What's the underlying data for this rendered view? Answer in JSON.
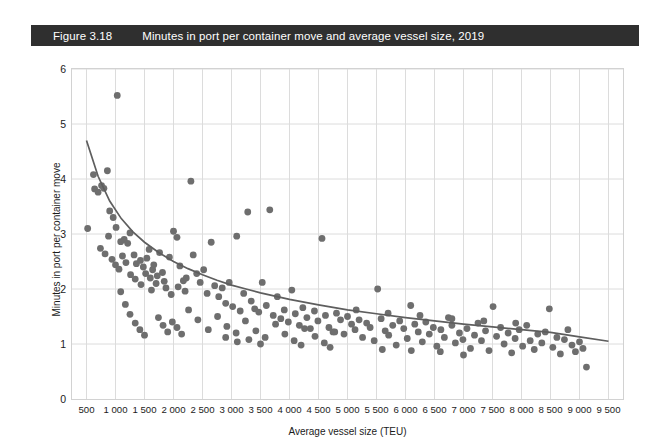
{
  "figure": {
    "number": "Figure 3.18",
    "title": "Minutes in port per container move and average vessel size, 2019",
    "bar_color": "#2f2f2f",
    "bar_text_color": "#ffffff"
  },
  "chart_data": {
    "type": "scatter",
    "title": "Minutes in port per container move and average vessel size, 2019",
    "xlabel": "Average vessel size (TEU)",
    "ylabel": "Minutes in port per container move",
    "xlim": [
      250,
      9750
    ],
    "ylim": [
      0,
      6
    ],
    "grid": true,
    "legend": null,
    "point_color": "#6e6e6e",
    "trend_color": "#5e5e5e",
    "xticks": [
      "500",
      "1 000",
      "1 500",
      "2 000",
      "2 500",
      "3 000",
      "3 500",
      "4 000",
      "4 500",
      "5 000",
      "5 500",
      "6 000",
      "6 500",
      "7 000",
      "7 500",
      "8 000",
      "8 500",
      "9 000",
      "9 500"
    ],
    "xtick_values": [
      500,
      1000,
      1500,
      2000,
      2500,
      3000,
      3500,
      4000,
      4500,
      5000,
      5500,
      6000,
      6500,
      7000,
      7500,
      8000,
      8500,
      9000,
      9500
    ],
    "yticks": [
      "0",
      "1",
      "2",
      "3",
      "4",
      "5",
      "6"
    ],
    "ytick_values": [
      0,
      1,
      2,
      3,
      4,
      5,
      6
    ],
    "trend_note": "Fitted decreasing power curve: ~4.7 minutes at 500 TEU falling to ~1.05 minutes at 9 500 TEU",
    "trend_points": [
      [
        500,
        4.7
      ],
      [
        700,
        4.05
      ],
      [
        900,
        3.6
      ],
      [
        1100,
        3.28
      ],
      [
        1300,
        3.04
      ],
      [
        1500,
        2.85
      ],
      [
        1750,
        2.66
      ],
      [
        2000,
        2.5
      ],
      [
        2250,
        2.37
      ],
      [
        2500,
        2.26
      ],
      [
        2750,
        2.16
      ],
      [
        3000,
        2.07
      ],
      [
        3250,
        2.0
      ],
      [
        3500,
        1.93
      ],
      [
        3750,
        1.87
      ],
      [
        4000,
        1.81
      ],
      [
        4500,
        1.71
      ],
      [
        5000,
        1.62
      ],
      [
        5500,
        1.55
      ],
      [
        6000,
        1.48
      ],
      [
        6500,
        1.42
      ],
      [
        7000,
        1.36
      ],
      [
        7500,
        1.31
      ],
      [
        8000,
        1.26
      ],
      [
        8500,
        1.21
      ],
      [
        9000,
        1.13
      ],
      [
        9500,
        1.05
      ]
    ],
    "points": [
      [
        1030,
        5.52
      ],
      [
        520,
        3.1
      ],
      [
        760,
        3.88
      ],
      [
        800,
        3.83
      ],
      [
        640,
        3.82
      ],
      [
        860,
        4.15
      ],
      [
        900,
        3.42
      ],
      [
        960,
        3.3
      ],
      [
        1010,
        3.12
      ],
      [
        1090,
        2.86
      ],
      [
        1150,
        2.9
      ],
      [
        1210,
        2.83
      ],
      [
        1250,
        3.02
      ],
      [
        1320,
        2.62
      ],
      [
        1360,
        2.46
      ],
      [
        1430,
        2.52
      ],
      [
        1480,
        2.4
      ],
      [
        1520,
        2.28
      ],
      [
        1600,
        2.2
      ],
      [
        1640,
        2.35
      ],
      [
        1700,
        2.1
      ],
      [
        1760,
        2.66
      ],
      [
        1810,
        2.3
      ],
      [
        1870,
        2.02
      ],
      [
        1930,
        2.58
      ],
      [
        2000,
        3.05
      ],
      [
        2060,
        2.94
      ],
      [
        2110,
        2.42
      ],
      [
        2170,
        2.15
      ],
      [
        2220,
        2.2
      ],
      [
        2300,
        3.96
      ],
      [
        2340,
        2.62
      ],
      [
        2400,
        2.28
      ],
      [
        2460,
        2.12
      ],
      [
        2520,
        2.35
      ],
      [
        2580,
        1.92
      ],
      [
        2650,
        2.85
      ],
      [
        2710,
        2.06
      ],
      [
        2780,
        1.86
      ],
      [
        2840,
        2.02
      ],
      [
        2900,
        1.74
      ],
      [
        2960,
        2.12
      ],
      [
        3020,
        1.68
      ],
      [
        3090,
        2.96
      ],
      [
        3150,
        1.6
      ],
      [
        3210,
        1.92
      ],
      [
        3280,
        3.4
      ],
      [
        3340,
        1.78
      ],
      [
        3400,
        1.64
      ],
      [
        3470,
        1.58
      ],
      [
        3530,
        2.12
      ],
      [
        3600,
        1.7
      ],
      [
        3660,
        3.44
      ],
      [
        3720,
        1.52
      ],
      [
        3790,
        1.86
      ],
      [
        3850,
        1.46
      ],
      [
        3910,
        1.62
      ],
      [
        3980,
        1.4
      ],
      [
        4040,
        1.98
      ],
      [
        4100,
        1.55
      ],
      [
        4170,
        1.34
      ],
      [
        4230,
        1.66
      ],
      [
        4300,
        1.48
      ],
      [
        4360,
        1.28
      ],
      [
        4430,
        1.6
      ],
      [
        4490,
        1.42
      ],
      [
        4560,
        2.92
      ],
      [
        4620,
        1.52
      ],
      [
        4680,
        1.3
      ],
      [
        4750,
        1.22
      ],
      [
        4810,
        1.56
      ],
      [
        4880,
        1.44
      ],
      [
        4940,
        1.18
      ],
      [
        5000,
        1.5
      ],
      [
        5070,
        1.36
      ],
      [
        5130,
        1.26
      ],
      [
        5200,
        1.44
      ],
      [
        5260,
        1.12
      ],
      [
        5330,
        1.38
      ],
      [
        5390,
        1.3
      ],
      [
        5460,
        1.06
      ],
      [
        5520,
        2.0
      ],
      [
        5580,
        1.46
      ],
      [
        5650,
        1.24
      ],
      [
        5710,
        1.16
      ],
      [
        5780,
        1.34
      ],
      [
        5840,
        0.98
      ],
      [
        5900,
        1.42
      ],
      [
        5970,
        1.28
      ],
      [
        6030,
        1.1
      ],
      [
        6090,
        1.7
      ],
      [
        6160,
        1.36
      ],
      [
        6220,
        1.22
      ],
      [
        6290,
        1.04
      ],
      [
        6350,
        1.4
      ],
      [
        6410,
        1.18
      ],
      [
        6480,
        1.3
      ],
      [
        6540,
        0.96
      ],
      [
        6610,
        1.26
      ],
      [
        6670,
        1.12
      ],
      [
        6740,
        1.48
      ],
      [
        6800,
        1.34
      ],
      [
        6860,
        1.02
      ],
      [
        6930,
        1.2
      ],
      [
        6990,
        1.08
      ],
      [
        7060,
        1.28
      ],
      [
        7120,
        0.92
      ],
      [
        7190,
        1.16
      ],
      [
        7250,
        1.38
      ],
      [
        7310,
        1.06
      ],
      [
        7380,
        1.24
      ],
      [
        7440,
        0.88
      ],
      [
        7510,
        1.68
      ],
      [
        7570,
        1.14
      ],
      [
        7640,
        1.3
      ],
      [
        7700,
        1.0
      ],
      [
        7770,
        1.2
      ],
      [
        7830,
        0.84
      ],
      [
        7890,
        1.1
      ],
      [
        7960,
        1.26
      ],
      [
        8020,
        0.96
      ],
      [
        8090,
        1.34
      ],
      [
        8150,
        1.06
      ],
      [
        8220,
        0.9
      ],
      [
        8280,
        1.18
      ],
      [
        8350,
        1.02
      ],
      [
        8410,
        1.22
      ],
      [
        8480,
        1.64
      ],
      [
        8540,
        0.94
      ],
      [
        8610,
        1.12
      ],
      [
        8670,
        0.82
      ],
      [
        8740,
        1.08
      ],
      [
        8800,
        1.26
      ],
      [
        8870,
        0.98
      ],
      [
        8930,
        0.86
      ],
      [
        9000,
        1.04
      ],
      [
        9060,
        0.92
      ],
      [
        9120,
        0.58
      ],
      [
        1090,
        1.95
      ],
      [
        1170,
        1.72
      ],
      [
        1250,
        1.54
      ],
      [
        1340,
        1.38
      ],
      [
        1420,
        1.26
      ],
      [
        1500,
        1.16
      ],
      [
        1580,
        2.72
      ],
      [
        1660,
        2.44
      ],
      [
        1740,
        1.48
      ],
      [
        1820,
        1.34
      ],
      [
        1900,
        1.22
      ],
      [
        1980,
        1.4
      ],
      [
        2060,
        1.3
      ],
      [
        2140,
        1.18
      ],
      [
        2260,
        1.62
      ],
      [
        2420,
        1.44
      ],
      [
        2600,
        1.26
      ],
      [
        2760,
        1.5
      ],
      [
        2920,
        1.32
      ],
      [
        3080,
        1.2
      ],
      [
        3240,
        1.42
      ],
      [
        3420,
        1.24
      ],
      [
        3580,
        1.12
      ],
      [
        3760,
        1.36
      ],
      [
        3920,
        1.18
      ],
      [
        4080,
        1.06
      ],
      [
        4260,
        1.28
      ],
      [
        4440,
        1.14
      ],
      [
        4600,
        1.02
      ],
      [
        4780,
        1.22
      ],
      [
        740,
        2.74
      ],
      [
        820,
        2.64
      ],
      [
        880,
        2.96
      ],
      [
        940,
        2.54
      ],
      [
        1000,
        2.44
      ],
      [
        1060,
        2.36
      ],
      [
        1120,
        2.6
      ],
      [
        1180,
        2.48
      ],
      [
        1260,
        2.26
      ],
      [
        1340,
        2.18
      ],
      [
        1440,
        2.08
      ],
      [
        1540,
        2.56
      ],
      [
        1620,
        1.98
      ],
      [
        1720,
        2.24
      ],
      [
        1840,
        2.14
      ],
      [
        1960,
        1.9
      ],
      [
        2080,
        2.04
      ],
      [
        2200,
        1.96
      ],
      [
        620,
        4.08
      ],
      [
        700,
        3.76
      ],
      [
        5600,
        0.9
      ],
      [
        6100,
        0.88
      ],
      [
        6600,
        0.86
      ],
      [
        7000,
        0.8
      ],
      [
        2900,
        1.12
      ],
      [
        3100,
        1.04
      ],
      [
        3300,
        1.08
      ],
      [
        3500,
        1.0
      ],
      [
        4200,
        0.98
      ],
      [
        4700,
        0.94
      ],
      [
        5150,
        1.62
      ],
      [
        5700,
        1.56
      ],
      [
        6250,
        1.52
      ],
      [
        6800,
        1.46
      ],
      [
        7350,
        1.42
      ],
      [
        7900,
        1.38
      ]
    ]
  }
}
